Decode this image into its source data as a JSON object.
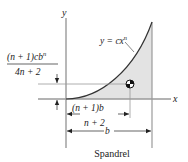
{
  "diagram": {
    "title": "Spandrel",
    "axes": {
      "x_label": "x",
      "y_label": "y"
    },
    "curve_label": "y = cx",
    "curve_exponent": "n",
    "centroid_y": {
      "numerator": "(n + 1)cb",
      "numerator_exp": "n",
      "denominator": "4n + 2"
    },
    "centroid_x": {
      "numerator": "(n + 1)b",
      "denominator": "n + 2"
    },
    "width_label": "b",
    "colors": {
      "fill": "#e3e3e3",
      "axis": "#9a9a9a",
      "curve": "#333333",
      "text": "#222222"
    }
  }
}
